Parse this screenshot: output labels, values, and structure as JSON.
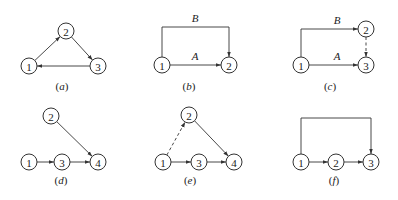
{
  "diagram": {
    "node_radius": 8,
    "colors": {
      "stroke": "#333333",
      "text": "#222222",
      "background": "#ffffff"
    },
    "panels": [
      {
        "id": "a",
        "caption": "(a)",
        "caption_pos": [
          62,
          90
        ],
        "nodes": [
          {
            "id": "1",
            "label": "1",
            "x": 29,
            "y": 66
          },
          {
            "id": "2",
            "label": "2",
            "x": 66,
            "y": 31
          },
          {
            "id": "3",
            "label": "3",
            "x": 98,
            "y": 66
          }
        ],
        "edges": [
          {
            "from": "1",
            "to": "2",
            "style": "solid",
            "path": "straight"
          },
          {
            "from": "2",
            "to": "3",
            "style": "solid",
            "path": "straight"
          },
          {
            "from": "3",
            "to": "1",
            "style": "solid",
            "path": "straight"
          }
        ]
      },
      {
        "id": "b",
        "caption": "(b)",
        "caption_pos": [
          189,
          90
        ],
        "nodes": [
          {
            "id": "1",
            "label": "1",
            "x": 162,
            "y": 65
          },
          {
            "id": "2",
            "label": "2",
            "x": 229,
            "y": 65
          }
        ],
        "edges": [
          {
            "from": "1",
            "to": "2",
            "style": "solid",
            "path": "straight",
            "label": "A",
            "label_pos": [
              195,
              60
            ]
          },
          {
            "from": "1",
            "to": "2",
            "style": "solid",
            "path": "over",
            "top_y": 27,
            "label": "B",
            "label_pos": [
              195,
              22
            ]
          }
        ]
      },
      {
        "id": "c",
        "caption": "(c)",
        "caption_pos": [
          330,
          90
        ],
        "nodes": [
          {
            "id": "1",
            "label": "1",
            "x": 301,
            "y": 65
          },
          {
            "id": "2",
            "label": "2",
            "x": 366,
            "y": 29
          },
          {
            "id": "3",
            "label": "3",
            "x": 366,
            "y": 65
          }
        ],
        "edges": [
          {
            "from": "1",
            "to": "3",
            "style": "solid",
            "path": "straight",
            "label": "A",
            "label_pos": [
              337,
              60
            ]
          },
          {
            "from": "1",
            "to": "2",
            "style": "solid",
            "path": "up-right",
            "label": "B",
            "label_pos": [
              337,
              24
            ]
          },
          {
            "from": "2",
            "to": "3",
            "style": "dashed",
            "path": "straight"
          }
        ]
      },
      {
        "id": "d",
        "caption": "(d)",
        "caption_pos": [
          61,
          184
        ],
        "nodes": [
          {
            "id": "1",
            "label": "1",
            "x": 29,
            "y": 162
          },
          {
            "id": "2",
            "label": "2",
            "x": 51,
            "y": 116
          },
          {
            "id": "3",
            "label": "3",
            "x": 62,
            "y": 162
          },
          {
            "id": "4",
            "label": "4",
            "x": 98,
            "y": 162
          }
        ],
        "edges": [
          {
            "from": "1",
            "to": "3",
            "style": "solid",
            "path": "straight"
          },
          {
            "from": "3",
            "to": "4",
            "style": "solid",
            "path": "straight"
          },
          {
            "from": "2",
            "to": "4",
            "style": "solid",
            "path": "straight"
          }
        ]
      },
      {
        "id": "e",
        "caption": "(e)",
        "caption_pos": [
          190,
          184
        ],
        "nodes": [
          {
            "id": "1",
            "label": "1",
            "x": 163,
            "y": 162
          },
          {
            "id": "2",
            "label": "2",
            "x": 189,
            "y": 115
          },
          {
            "id": "3",
            "label": "3",
            "x": 199,
            "y": 162
          },
          {
            "id": "4",
            "label": "4",
            "x": 234,
            "y": 162
          }
        ],
        "edges": [
          {
            "from": "1",
            "to": "3",
            "style": "solid",
            "path": "straight"
          },
          {
            "from": "3",
            "to": "4",
            "style": "solid",
            "path": "straight"
          },
          {
            "from": "2",
            "to": "4",
            "style": "solid",
            "path": "straight"
          },
          {
            "from": "1",
            "to": "2",
            "style": "dashed",
            "path": "straight"
          }
        ]
      },
      {
        "id": "f",
        "caption": "(f)",
        "caption_pos": [
          334,
          184
        ],
        "nodes": [
          {
            "id": "1",
            "label": "1",
            "x": 301,
            "y": 162
          },
          {
            "id": "2",
            "label": "2",
            "x": 336,
            "y": 162
          },
          {
            "id": "3",
            "label": "3",
            "x": 371,
            "y": 162
          }
        ],
        "edges": [
          {
            "from": "1",
            "to": "2",
            "style": "solid",
            "path": "straight"
          },
          {
            "from": "2",
            "to": "3",
            "style": "solid",
            "path": "straight"
          },
          {
            "from": "1",
            "to": "3",
            "style": "solid",
            "path": "over",
            "top_y": 118
          }
        ]
      }
    ]
  }
}
